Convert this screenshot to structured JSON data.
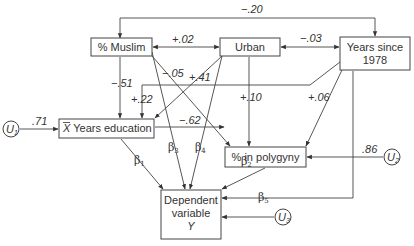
{
  "nodes": {
    "muslim": "% Muslim",
    "urban": "Urban",
    "years_since_line1": "Years since",
    "years_since_line2": "1978",
    "education": "X̄ Years education",
    "education_bar_letter": "X",
    "education_rest": " Years education",
    "polygyny": "% in polygyny",
    "dependent_line1": "Dependent",
    "dependent_line2": "variable",
    "dependent_line3": "Y"
  },
  "error_terms": {
    "u1": {
      "letter": "U",
      "sub": "1"
    },
    "u2": {
      "letter": "U",
      "sub": "2"
    },
    "u3": {
      "letter": "U",
      "sub": "3"
    }
  },
  "coefficients": {
    "muslim_years": "−.20",
    "muslim_urban": "+.02",
    "urban_years": "−.03",
    "muslim_education": "−.51",
    "muslim_polygyny": "−.05",
    "urban_education": "+.41",
    "years_education": "+.22",
    "urban_polygyny": "+.10",
    "years_polygyny": "+.06",
    "education_polygyny": "−.62",
    "u1_education": ".71",
    "u2_polygyny": ".86"
  },
  "betas": {
    "b1": {
      "symbol": "β",
      "sub": "1"
    },
    "b2": {
      "symbol": "β",
      "sub": "2"
    },
    "b3": {
      "symbol": "β",
      "sub": "3"
    },
    "b4": {
      "symbol": "β",
      "sub": "4"
    },
    "b5": {
      "symbol": "β",
      "sub": "5"
    }
  }
}
